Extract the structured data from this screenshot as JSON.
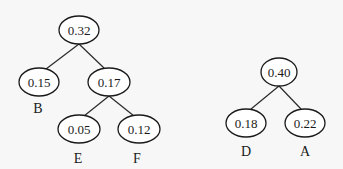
{
  "diagram": {
    "type": "huffman-forest",
    "trees": [
      {
        "root": "n032",
        "nodes": [
          {
            "id": "n032",
            "value": "0.32",
            "cx": 79,
            "cy": 30,
            "label": ""
          },
          {
            "id": "n015",
            "value": "0.15",
            "cx": 39,
            "cy": 82,
            "label": "B"
          },
          {
            "id": "n017",
            "value": "0.17",
            "cx": 109,
            "cy": 82,
            "label": ""
          },
          {
            "id": "n005",
            "value": "0.05",
            "cx": 79,
            "cy": 129,
            "label": "E"
          },
          {
            "id": "n012",
            "value": "0.12",
            "cx": 139,
            "cy": 129,
            "label": "F"
          }
        ],
        "edges": [
          [
            "n032",
            "n015"
          ],
          [
            "n032",
            "n017"
          ],
          [
            "n017",
            "n005"
          ],
          [
            "n017",
            "n012"
          ]
        ]
      },
      {
        "root": "n040",
        "nodes": [
          {
            "id": "n040",
            "value": "0.40",
            "cx": 279,
            "cy": 72,
            "label": ""
          },
          {
            "id": "n018",
            "value": "0.18",
            "cx": 246,
            "cy": 123,
            "label": "D"
          },
          {
            "id": "n022",
            "value": "0.22",
            "cx": 305,
            "cy": 123,
            "label": "A"
          }
        ],
        "edges": [
          [
            "n040",
            "n018"
          ],
          [
            "n040",
            "n022"
          ]
        ]
      }
    ]
  },
  "labels": {
    "t1_root": "0.32",
    "t1_left": "0.15",
    "t1_right": "0.17",
    "t1_rl": "0.05",
    "t1_rr": "0.12",
    "t1_left_sym": "B",
    "t1_rl_sym": "E",
    "t1_rr_sym": "F",
    "t2_root": "0.40",
    "t2_left": "0.18",
    "t2_right": "0.22",
    "t2_left_sym": "D",
    "t2_right_sym": "A"
  }
}
